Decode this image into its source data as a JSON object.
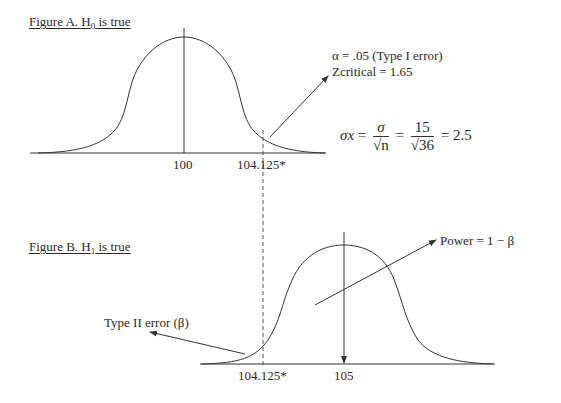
{
  "figure_a": {
    "title_prefix": "Figure A.  H",
    "title_sub": "0",
    "title_suffix": " is true",
    "mean_label": "100",
    "critical_label": "104.125*",
    "annotation_line1": "α = .05 (Type I error)",
    "annotation_line2": "Zcritical = 1.65"
  },
  "formula": {
    "lhs": "σx",
    "eq1": "=",
    "frac1_num": "σ",
    "frac1_den": "√n",
    "eq2": "=",
    "frac2_num": "15",
    "frac2_den": "√36",
    "eq3": "= 2.5"
  },
  "figure_b": {
    "title_prefix": "Figure B.  H",
    "title_sub": "1",
    "title_suffix": " is true",
    "mean_label": "105",
    "critical_label": "104.125*",
    "power_label": "Power = 1 − β",
    "type2_label": "Type II error (β)"
  },
  "colors": {
    "line": "#333333",
    "text": "#2a2a2a",
    "background": "#ffffff"
  }
}
